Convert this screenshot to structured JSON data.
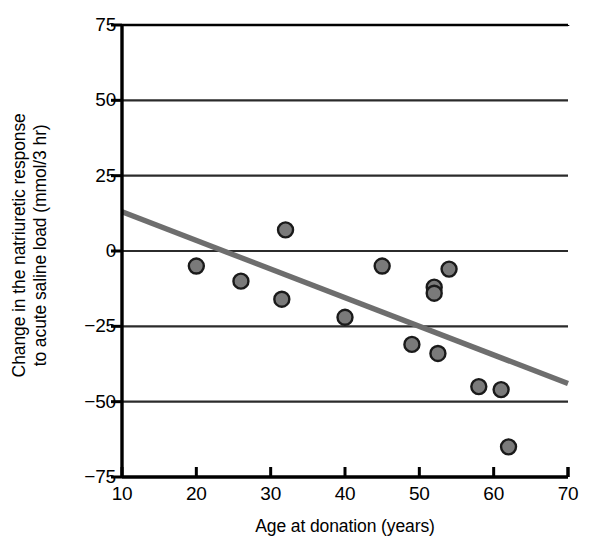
{
  "chart_data": {
    "type": "scatter",
    "title": "",
    "xlabel": "Age at donation (years)",
    "ylabel": "Change in the natriuretic response to acute saline load (mmol/3 hr)",
    "ylabel_line1": "Change in the natriuretic response",
    "ylabel_line2": "to acute saline load (mmol/3 hr)",
    "xlim": [
      10,
      70
    ],
    "ylim": [
      -75,
      75
    ],
    "xticks": [
      10,
      20,
      30,
      40,
      50,
      60,
      70
    ],
    "xtick_labels": [
      "10",
      "20",
      "30",
      "40",
      "50",
      "60",
      "70"
    ],
    "yticks": [
      75,
      50,
      25,
      0,
      -25,
      -50,
      -75
    ],
    "ytick_labels": [
      "75",
      "50",
      "25",
      "0",
      "−25",
      "−50",
      "−75"
    ],
    "grid": "horizontal",
    "gridlines_y": [
      50,
      25,
      0,
      -25,
      -50
    ],
    "legend": "none",
    "points": [
      {
        "x": 20,
        "y": -5
      },
      {
        "x": 26,
        "y": -10
      },
      {
        "x": 31.5,
        "y": -16
      },
      {
        "x": 32,
        "y": 7
      },
      {
        "x": 40,
        "y": -22
      },
      {
        "x": 45,
        "y": -5
      },
      {
        "x": 49,
        "y": -31
      },
      {
        "x": 52,
        "y": -12
      },
      {
        "x": 52,
        "y": -14
      },
      {
        "x": 52.5,
        "y": -34
      },
      {
        "x": 54,
        "y": -6
      },
      {
        "x": 58,
        "y": -45
      },
      {
        "x": 61,
        "y": -46
      },
      {
        "x": 62,
        "y": -65
      }
    ],
    "trendline": {
      "type": "line",
      "x0": 10,
      "y0": 13,
      "x1": 70,
      "y1": -44
    },
    "colors": {
      "marker_fill": "#7a7a7a",
      "marker_edge": "#1a1a1a",
      "trendline": "#6e6e6e",
      "axis": "#000000",
      "gridline": "#2b2b2b",
      "background": "#ffffff"
    },
    "marker_radius_px": 7.5
  }
}
